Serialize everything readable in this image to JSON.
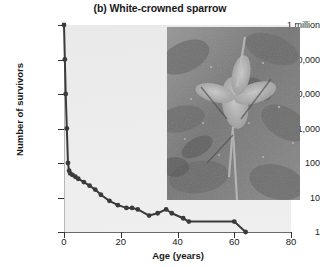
{
  "chart_data": {
    "type": "line",
    "title": "(b) White-crowned sparrow",
    "subtitle": "",
    "xlabel": "Age (years)",
    "ylabel": "Number of survivors",
    "xlim": [
      0,
      80
    ],
    "ylim": [
      1,
      1000000
    ],
    "yscale": "log",
    "grid": false,
    "legend": null,
    "xticks": [
      0,
      20,
      40,
      60,
      80
    ],
    "xtick_labels": [
      "0",
      "20",
      "40",
      "60",
      "80"
    ],
    "yticks": [
      1,
      10,
      100,
      1000,
      10000,
      100000,
      1000000
    ],
    "ytick_labels": [
      "1",
      "10",
      "100",
      "1,000",
      "10,000",
      "100,000",
      "1 million"
    ],
    "series": [
      {
        "name": "White-crowned sparrow survivorship",
        "x": [
          0,
          0.3,
          0.6,
          1,
          1.4,
          1.8,
          2.2,
          3,
          4,
          5,
          7,
          9,
          11,
          13,
          16,
          19,
          22,
          24,
          26,
          30,
          33,
          36,
          38,
          42,
          44,
          60,
          64
        ],
        "y": [
          1000000,
          100000,
          10000,
          1000,
          100,
          60,
          50,
          45,
          40,
          35,
          28,
          22,
          17,
          12,
          8,
          6,
          5,
          5,
          4.5,
          3,
          3.5,
          4.5,
          3.5,
          2.5,
          2,
          2,
          1
        ]
      }
    ],
    "annotations": [
      {
        "name": "habitat-photograph",
        "description": "Grayscale photograph inset of flowering plants and foliage"
      }
    ]
  },
  "axis": {
    "y_ticks": [
      {
        "label": "1 million",
        "top": 25
      },
      {
        "label": "100,000",
        "top": 59.5
      },
      {
        "label": "10,000",
        "top": 94
      },
      {
        "label": "1,000",
        "top": 128.5
      },
      {
        "label": "100",
        "top": 163
      },
      {
        "label": "10",
        "top": 197.5
      },
      {
        "label": "1",
        "top": 232
      }
    ],
    "x_ticks": [
      {
        "label": "0",
        "left": 64
      },
      {
        "label": "20",
        "left": 120.75
      },
      {
        "label": "40",
        "left": 177.5
      },
      {
        "label": "60",
        "left": 234.25
      },
      {
        "label": "80",
        "left": 291
      }
    ]
  }
}
